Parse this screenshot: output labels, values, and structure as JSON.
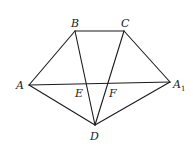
{
  "diagram": {
    "points": {
      "A": {
        "label": "A",
        "x": 29,
        "y": 85
      },
      "B": {
        "label": "B",
        "x": 75,
        "y": 31
      },
      "C": {
        "label": "C",
        "x": 124,
        "y": 31
      },
      "A1": {
        "label": "A",
        "sub": "1",
        "x": 170,
        "y": 82
      },
      "D": {
        "label": "D",
        "x": 95,
        "y": 125
      },
      "E": {
        "label": "E"
      },
      "F": {
        "label": "F"
      }
    },
    "segments": [
      "AB",
      "BC",
      "CA1",
      "AA1",
      "AD",
      "DA1",
      "BD",
      "CD"
    ]
  }
}
